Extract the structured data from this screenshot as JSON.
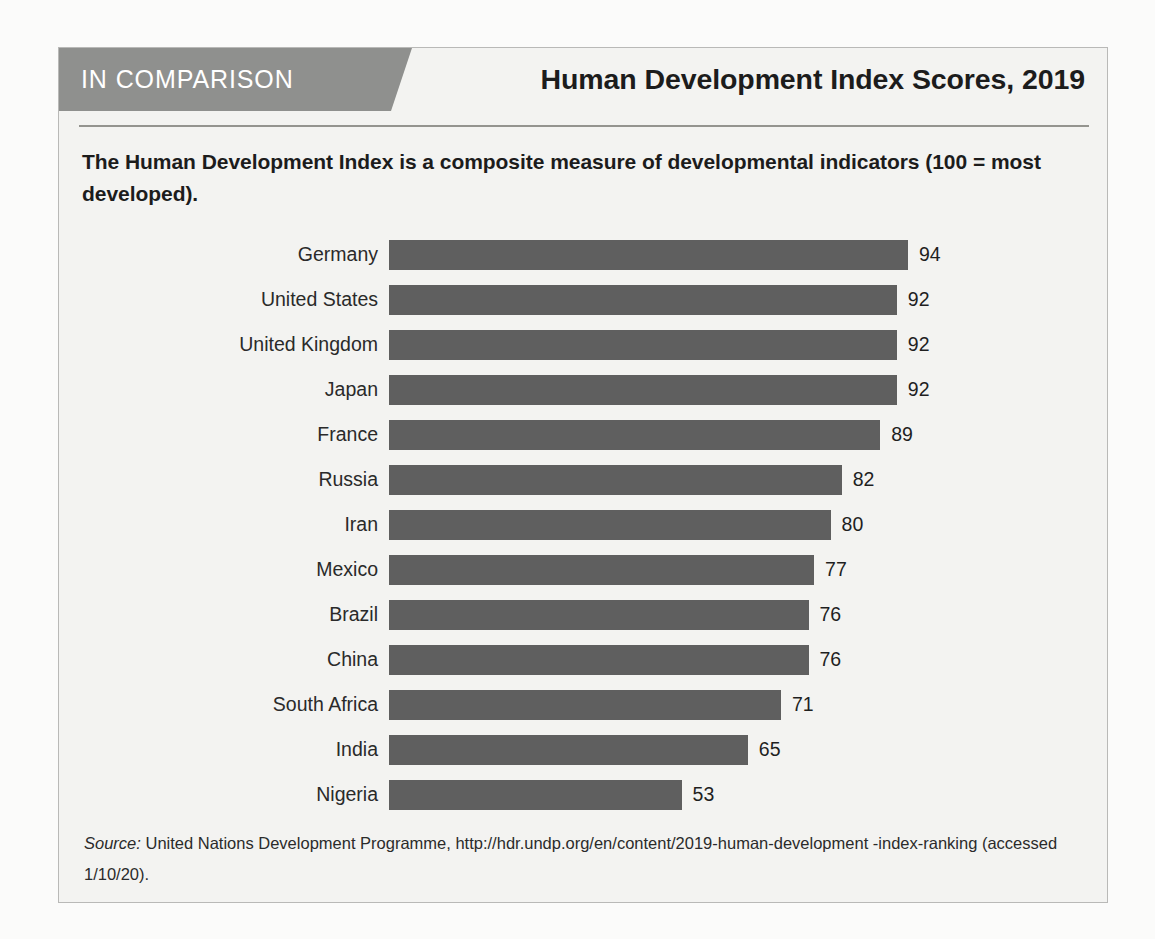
{
  "figure": {
    "banner_label": "IN COMPARISON",
    "title": "Human Development Index Scores, 2019",
    "description": "The Human Development Index is a composite measure of developmental indicators (100 = most developed).",
    "source_prefix": "Source:",
    "source_text": " United Nations Development Programme, http://hdr.undp.org/en/content/2019-human-development -index-ranking (accessed 1/10/20)."
  },
  "colors": {
    "banner": "#8f908e",
    "bar": "#5f5f5f",
    "card_background": "#f3f3f1",
    "card_border": "#b9b9b7",
    "page_background": "#fbfbfa",
    "rule": "#94948f",
    "text": "#1c1c1c"
  },
  "chart_data": {
    "type": "bar",
    "orientation": "horizontal",
    "title": "Human Development Index Scores, 2019",
    "subtitle": "The Human Development Index is a composite measure of developmental indicators (100 = most developed).",
    "xlabel": "",
    "ylabel": "",
    "xlim": [
      0,
      100
    ],
    "grid": false,
    "legend": false,
    "data_labels": true,
    "categories": [
      "Germany",
      "United States",
      "United Kingdom",
      "Japan",
      "France",
      "Russia",
      "Iran",
      "Mexico",
      "Brazil",
      "China",
      "South Africa",
      "India",
      "Nigeria"
    ],
    "values": [
      94,
      92,
      92,
      92,
      89,
      82,
      80,
      77,
      76,
      76,
      71,
      65,
      53
    ],
    "rows": [
      {
        "label": "Germany",
        "value": 94
      },
      {
        "label": "United States",
        "value": 92
      },
      {
        "label": "United Kingdom",
        "value": 92
      },
      {
        "label": "Japan",
        "value": 92
      },
      {
        "label": "France",
        "value": 89
      },
      {
        "label": "Russia",
        "value": 82
      },
      {
        "label": "Iran",
        "value": 80
      },
      {
        "label": "Mexico",
        "value": 77
      },
      {
        "label": "Brazil",
        "value": 76
      },
      {
        "label": "China",
        "value": 76
      },
      {
        "label": "South Africa",
        "value": 71
      },
      {
        "label": "India",
        "value": 65
      },
      {
        "label": "Nigeria",
        "value": 53
      }
    ]
  }
}
